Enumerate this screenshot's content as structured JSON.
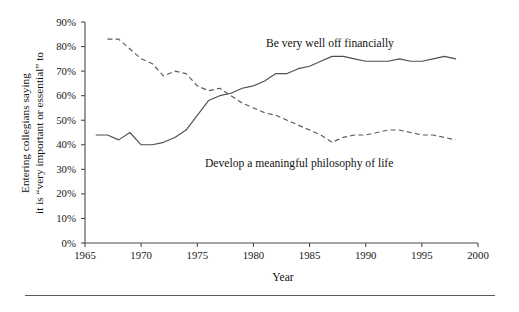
{
  "figure": {
    "y_axis_label_line1": "Entering collegians saying",
    "y_axis_label_line2": "it is “very important or essential” to",
    "x_axis_title": "Year",
    "annotation_solid": "Be very well off financially",
    "annotation_dashed": "Develop a meaningful philosophy of life",
    "line_color_solid": "#4f4f4f",
    "line_color_dashed": "#5a5a5a",
    "axis_color": "#4a4a4a",
    "background": "#ffffff"
  },
  "chart_data": {
    "type": "line",
    "title": "",
    "xlabel": "Year",
    "ylabel": "Entering collegians saying it is “very important or essential” to",
    "xlim": [
      1965,
      2000
    ],
    "ylim": [
      0,
      90
    ],
    "xticks": [
      1965,
      1970,
      1975,
      1980,
      1985,
      1990,
      1995,
      2000
    ],
    "xticklabels": [
      "1965",
      "1970",
      "1975",
      "1980",
      "1985",
      "1990",
      "1995",
      "2000"
    ],
    "yticks": [
      0,
      10,
      20,
      30,
      40,
      50,
      60,
      70,
      80,
      90
    ],
    "yticklabels": [
      "0%",
      "10%",
      "20%",
      "30%",
      "40%",
      "50%",
      "60%",
      "70%",
      "80%",
      "90%"
    ],
    "grid": false,
    "legend": "inline-annotations",
    "series": [
      {
        "name": "Be very well off financially",
        "style": "solid",
        "x": [
          1966,
          1967,
          1968,
          1969,
          1970,
          1971,
          1972,
          1973,
          1974,
          1975,
          1976,
          1977,
          1978,
          1979,
          1980,
          1981,
          1982,
          1983,
          1984,
          1985,
          1986,
          1987,
          1988,
          1989,
          1990,
          1991,
          1992,
          1993,
          1994,
          1995,
          1996,
          1997,
          1998
        ],
        "y": [
          44,
          44,
          42,
          45,
          40,
          40,
          41,
          43,
          46,
          52,
          58,
          60,
          61,
          63,
          64,
          66,
          69,
          69,
          71,
          72,
          74,
          76,
          76,
          75,
          74,
          74,
          74,
          75,
          74,
          74,
          75,
          76,
          75
        ]
      },
      {
        "name": "Develop a meaningful philosophy of life",
        "style": "dashed",
        "x": [
          1967,
          1968,
          1969,
          1970,
          1971,
          1972,
          1973,
          1974,
          1975,
          1976,
          1977,
          1978,
          1979,
          1980,
          1981,
          1982,
          1983,
          1984,
          1985,
          1986,
          1987,
          1988,
          1989,
          1990,
          1991,
          1992,
          1993,
          1994,
          1995,
          1996,
          1997,
          1998
        ],
        "y": [
          83,
          83,
          79,
          75,
          73,
          68,
          70,
          69,
          64,
          62,
          63,
          60,
          57,
          55,
          53,
          52,
          50,
          48,
          46,
          44,
          41,
          43,
          44,
          44,
          45,
          46,
          46,
          45,
          44,
          44,
          43,
          42
        ]
      }
    ]
  }
}
